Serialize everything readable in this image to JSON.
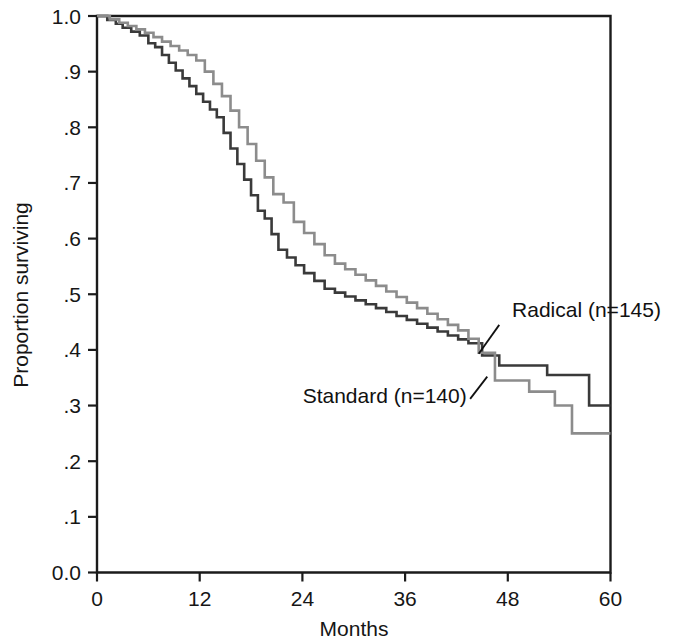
{
  "chart_data": {
    "type": "line",
    "subtype": "kaplan-meier-step",
    "title": "",
    "xlabel": "Months",
    "ylabel": "Proportion surviving",
    "xlim": [
      0,
      60
    ],
    "ylim": [
      0,
      1.0
    ],
    "xticks": [
      0,
      12,
      24,
      36,
      48,
      60
    ],
    "xtick_labels": [
      "0",
      "12",
      "24",
      "36",
      "48",
      "60"
    ],
    "yticks": [
      0.0,
      0.1,
      0.2,
      0.3,
      0.4,
      0.5,
      0.6,
      0.7,
      0.8,
      0.9,
      1.0
    ],
    "ytick_labels": [
      "0.0",
      ".1",
      ".2",
      ".3",
      ".4",
      ".5",
      ".6",
      ".7",
      ".8",
      ".9",
      "1.0"
    ],
    "grid": false,
    "legend_position": "inline-annotation",
    "frame": "box",
    "series": [
      {
        "name": "Radical (n=145)",
        "label": "Radical (n=145)",
        "color": "#3a3a3a",
        "linewidth": 2.6,
        "x": [
          0,
          1.2,
          2.2,
          3.0,
          4.0,
          5.0,
          6.0,
          6.8,
          7.6,
          8.4,
          9.2,
          10.0,
          10.8,
          11.6,
          12.4,
          13.2,
          14.0,
          14.8,
          15.6,
          16.4,
          17.2,
          18.0,
          18.8,
          19.6,
          20.4,
          21.2,
          22.2,
          23.2,
          24.2,
          25.4,
          26.6,
          27.8,
          29.0,
          30.2,
          31.4,
          32.6,
          33.8,
          35.0,
          36.2,
          37.4,
          38.6,
          39.8,
          41.0,
          42.2,
          43.4,
          45.0,
          47.0,
          52.6,
          57.5,
          60
        ],
        "y": [
          1.0,
          0.993,
          0.986,
          0.979,
          0.972,
          0.965,
          0.951,
          0.944,
          0.93,
          0.916,
          0.902,
          0.888,
          0.874,
          0.86,
          0.846,
          0.832,
          0.818,
          0.79,
          0.762,
          0.734,
          0.706,
          0.678,
          0.65,
          0.636,
          0.608,
          0.58,
          0.566,
          0.552,
          0.538,
          0.524,
          0.51,
          0.503,
          0.496,
          0.489,
          0.482,
          0.475,
          0.468,
          0.461,
          0.454,
          0.447,
          0.44,
          0.433,
          0.426,
          0.419,
          0.412,
          0.39,
          0.372,
          0.355,
          0.3,
          0.3
        ]
      },
      {
        "name": "Standard (n=140)",
        "label": "Standard (n=140)",
        "color": "#8c8c8c",
        "linewidth": 2.6,
        "x": [
          0,
          1.5,
          2.6,
          3.6,
          4.6,
          5.6,
          6.6,
          7.6,
          8.6,
          9.6,
          10.6,
          11.6,
          12.6,
          13.6,
          14.6,
          15.6,
          16.6,
          17.6,
          18.6,
          19.6,
          20.6,
          21.8,
          23.0,
          24.2,
          25.4,
          26.6,
          27.8,
          29.0,
          30.2,
          31.4,
          32.6,
          33.8,
          35.0,
          36.2,
          37.4,
          38.6,
          39.8,
          41.0,
          42.2,
          43.4,
          44.6,
          46.5,
          50.5,
          53.5,
          55.5,
          60
        ],
        "y": [
          1.0,
          0.994,
          0.988,
          0.982,
          0.976,
          0.97,
          0.962,
          0.954,
          0.946,
          0.938,
          0.93,
          0.92,
          0.9,
          0.878,
          0.856,
          0.83,
          0.8,
          0.77,
          0.74,
          0.71,
          0.68,
          0.665,
          0.63,
          0.61,
          0.59,
          0.57,
          0.555,
          0.545,
          0.535,
          0.525,
          0.515,
          0.505,
          0.495,
          0.485,
          0.475,
          0.465,
          0.455,
          0.445,
          0.435,
          0.42,
          0.395,
          0.345,
          0.325,
          0.3,
          0.25,
          0.25
        ]
      }
    ],
    "annotations": [
      {
        "name": "radical-annotation",
        "text": "Radical (n=145)",
        "text_x": 48.5,
        "text_y": 0.46,
        "leader_from_x": 47.0,
        "leader_from_y": 0.445,
        "leader_to_x": 44.6,
        "leader_to_y": 0.393
      },
      {
        "name": "standard-annotation",
        "text": "Standard (n=140)",
        "text_x": 43.2,
        "text_y": 0.305,
        "leader_from_x": 43.6,
        "leader_from_y": 0.312,
        "leader_to_x": 45.6,
        "leader_to_y": 0.352
      }
    ]
  },
  "axes": {
    "y_title": "Proportion surviving",
    "x_title": "Months"
  }
}
